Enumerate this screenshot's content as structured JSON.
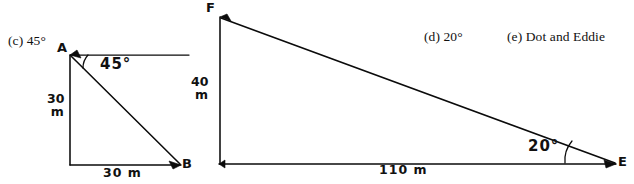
{
  "page": {
    "background_color": "#ffffff",
    "ink_color": "#0b0b0b"
  },
  "answers": [
    {
      "key": "c",
      "text": "(c) 45°"
    },
    {
      "key": "d",
      "text": "(d) 20°"
    },
    {
      "key": "e",
      "text": "(e) Dot and Eddie"
    }
  ],
  "figures": [
    {
      "id": "triangle-ab",
      "vertices": [
        {
          "name": "A",
          "label": "A"
        },
        {
          "name": "B",
          "label": "B"
        }
      ],
      "angle": {
        "value": "45°",
        "at_vertex": "A"
      },
      "dimensions": [
        {
          "name": "vertical-side",
          "value": "30",
          "unit": "m"
        },
        {
          "name": "horizontal-side",
          "value": "30 m"
        }
      ]
    },
    {
      "id": "triangle-fe",
      "vertices": [
        {
          "name": "F",
          "label": "F"
        },
        {
          "name": "E",
          "label": "E"
        }
      ],
      "angle": {
        "value": "20°",
        "at_vertex": "E"
      },
      "dimensions": [
        {
          "name": "vertical-side",
          "value": "40",
          "unit": "m"
        },
        {
          "name": "horizontal-side",
          "value": "110 m"
        }
      ]
    }
  ]
}
